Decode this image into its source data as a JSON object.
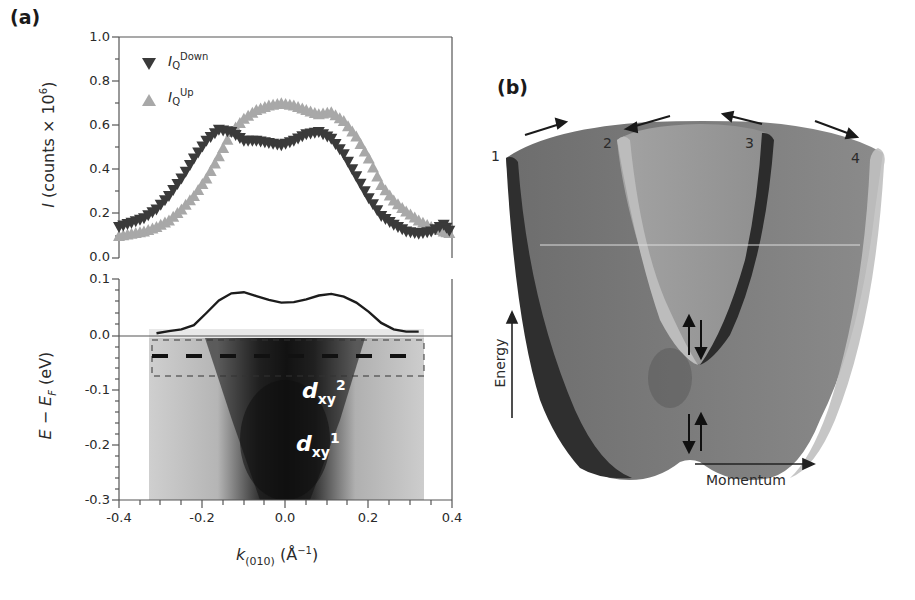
{
  "figure": {
    "panel_a_label": "(a)",
    "panel_b_label": "(b)"
  },
  "colors": {
    "down_series": "#3a3a3a",
    "up_series": "#a8a8a8",
    "axis": "#444444",
    "band_outer": "#7a7a7a",
    "band_inner": "#9a9a9a",
    "band_edge_dark": "#2e2e2e",
    "band_edge_light": "#b8b8b8"
  },
  "top_plot": {
    "ylabel_main": "I",
    "ylabel_rest": " (counts × 10",
    "ylabel_sup": "6",
    "ylabel_close": ")",
    "yticks": [
      "1.0",
      "0.8",
      "0.6",
      "0.4",
      "0.2",
      "0.0"
    ],
    "legend": [
      {
        "symbol": "down-triangle",
        "main": "I",
        "sub": "Q",
        "sup": "Down"
      },
      {
        "symbol": "up-triangle",
        "main": "I",
        "sub": "Q",
        "sup": "Up"
      }
    ]
  },
  "bottom_plot": {
    "ylabel": "E − E",
    "ylabel_sub": "F",
    "ylabel_unit": " (eV)",
    "yticks": [
      "0.1",
      "0.0",
      "-0.1",
      "-0.2",
      "-0.3"
    ],
    "xticks": [
      "-0.4",
      "-0.2",
      "0.0",
      "0.2",
      "0.4"
    ],
    "xlabel_main": "k",
    "xlabel_sub": "(010)",
    "xlabel_unit": " (Å",
    "xlabel_sup": "−1",
    "xlabel_close": ")",
    "band_labels": [
      {
        "main": "d",
        "sub": "xy",
        "sup": "2"
      },
      {
        "main": "d",
        "sub": "xy",
        "sup": "1"
      }
    ]
  },
  "schematic": {
    "numbers": [
      "1",
      "2",
      "3",
      "4"
    ],
    "energy_label": "Energy",
    "momentum_label": "Momentum"
  },
  "chart_data": [
    {
      "type": "scatter",
      "title": "",
      "xlabel": "k(010) (Å⁻¹)",
      "ylabel": "I (counts × 10^6)",
      "xlim": [
        -0.4,
        0.4
      ],
      "ylim": [
        0.0,
        1.0
      ],
      "legend_position": "upper left",
      "series": [
        {
          "name": "I_Q^Down",
          "marker": "down-triangle",
          "x": [
            -0.4,
            -0.37,
            -0.34,
            -0.31,
            -0.28,
            -0.25,
            -0.22,
            -0.19,
            -0.16,
            -0.13,
            -0.1,
            -0.07,
            -0.04,
            -0.01,
            0.02,
            0.05,
            0.08,
            0.11,
            0.14,
            0.17,
            0.2,
            0.23,
            0.26,
            0.29,
            0.32,
            0.35,
            0.38,
            0.4
          ],
          "y": [
            0.14,
            0.16,
            0.18,
            0.22,
            0.28,
            0.36,
            0.45,
            0.53,
            0.58,
            0.57,
            0.53,
            0.53,
            0.52,
            0.51,
            0.53,
            0.56,
            0.57,
            0.54,
            0.47,
            0.37,
            0.27,
            0.19,
            0.15,
            0.12,
            0.11,
            0.12,
            0.15,
            0.11
          ]
        },
        {
          "name": "I_Q^Up",
          "marker": "up-triangle",
          "x": [
            -0.4,
            -0.37,
            -0.34,
            -0.31,
            -0.28,
            -0.25,
            -0.22,
            -0.19,
            -0.16,
            -0.13,
            -0.1,
            -0.07,
            -0.04,
            -0.01,
            0.02,
            0.05,
            0.08,
            0.11,
            0.14,
            0.17,
            0.2,
            0.23,
            0.26,
            0.29,
            0.32,
            0.35,
            0.38,
            0.4
          ],
          "y": [
            0.1,
            0.11,
            0.12,
            0.14,
            0.17,
            0.22,
            0.28,
            0.36,
            0.46,
            0.57,
            0.63,
            0.67,
            0.69,
            0.7,
            0.69,
            0.67,
            0.65,
            0.66,
            0.62,
            0.55,
            0.45,
            0.33,
            0.26,
            0.21,
            0.17,
            0.14,
            0.12,
            0.11
          ]
        }
      ]
    },
    {
      "type": "line",
      "title": "",
      "xlabel": "k(010) (Å⁻¹)",
      "ylabel": "E − E_F (eV)",
      "xlim": [
        -0.4,
        0.4
      ],
      "ylim": [
        -0.3,
        0.1
      ],
      "description": "Momentum distribution curve (upper inset above E_F) over ARPES intensity map; dashed boxes mark integration window near -0.04 eV",
      "series": [
        {
          "name": "MDC",
          "x": [
            -0.31,
            -0.28,
            -0.25,
            -0.22,
            -0.19,
            -0.16,
            -0.13,
            -0.1,
            -0.07,
            -0.04,
            -0.01,
            0.02,
            0.05,
            0.08,
            0.11,
            0.14,
            0.17,
            0.2,
            0.23,
            0.26,
            0.29,
            0.32
          ],
          "y": [
            0.005,
            0.009,
            0.012,
            0.02,
            0.042,
            0.065,
            0.078,
            0.08,
            0.073,
            0.066,
            0.061,
            0.062,
            0.067,
            0.074,
            0.077,
            0.072,
            0.061,
            0.044,
            0.024,
            0.012,
            0.008,
            0.008
          ]
        }
      ],
      "annotations": [
        "d_xy^2 at ~-0.1 eV",
        "d_xy^1 at ~-0.2 eV"
      ]
    },
    {
      "type": "diagram",
      "title": "Schematic spin-split band structure",
      "labels": [
        "1",
        "2",
        "3",
        "4",
        "Energy",
        "Momentum"
      ]
    }
  ]
}
